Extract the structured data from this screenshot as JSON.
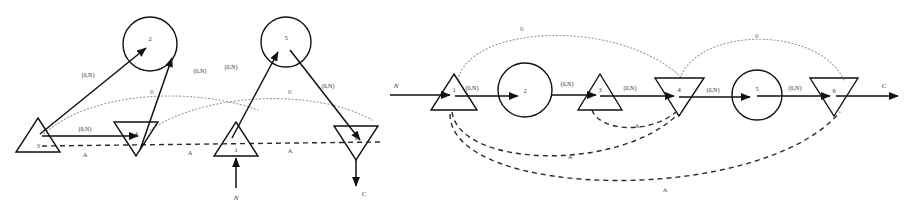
{
  "figure": {
    "background": "#ffffff",
    "ink": "#111111",
    "arc_r_color": "#9a9a9a",
    "arc_a_color": "#2b2b2b"
  },
  "edge_label": "(0,N)",
  "arc_labels": {
    "resource": "R",
    "assembly": "A"
  },
  "io_labels": {
    "input": "N",
    "output": "C"
  },
  "left_diagram": {
    "nodes": [
      {
        "id": "3",
        "label": "3",
        "shape": "triangle-up",
        "cx": 38,
        "cy": 138
      },
      {
        "id": "2",
        "label": "2",
        "shape": "circle",
        "cx": 150,
        "cy": 44
      },
      {
        "id": "4",
        "label": "4",
        "shape": "triangle-down",
        "cx": 136,
        "cy": 136
      },
      {
        "id": "5",
        "label": "5",
        "shape": "circle",
        "cx": 286,
        "cy": 42
      },
      {
        "id": "1",
        "label": "1",
        "shape": "triangle-up",
        "cx": 236,
        "cy": 142
      },
      {
        "id": "6",
        "label": "6",
        "shape": "triangle-down",
        "cx": 356,
        "cy": 140
      }
    ],
    "solid_edges": [
      {
        "from": "3",
        "to": "2",
        "label": "(0,N)"
      },
      {
        "from": "3",
        "to": "4",
        "label": "(0,N)"
      },
      {
        "from": "4",
        "to": "2",
        "label": "(0,N)"
      },
      {
        "from": "1",
        "to": "5",
        "label": "(0,N)"
      },
      {
        "from": "5",
        "to": "6",
        "label": "(0,N)"
      }
    ],
    "dotted_arcs": [
      {
        "label": "R"
      },
      {
        "label": "R"
      }
    ],
    "dashed_line_labels": [
      "A",
      "A",
      "A"
    ],
    "input": {
      "label": "N",
      "at": "1"
    },
    "output": {
      "label": "C",
      "at": "6"
    }
  },
  "right_diagram": {
    "nodes": [
      {
        "id": "1",
        "label": "1",
        "shape": "triangle-up",
        "cx": 454,
        "cy": 96
      },
      {
        "id": "2",
        "label": "2",
        "shape": "circle",
        "cx": 525,
        "cy": 90
      },
      {
        "id": "3",
        "label": "3",
        "shape": "triangle-up",
        "cx": 600,
        "cy": 95
      },
      {
        "id": "4",
        "label": "4",
        "shape": "triangle-down",
        "cx": 679,
        "cy": 92
      },
      {
        "id": "5",
        "label": "5",
        "shape": "circle",
        "cx": 757,
        "cy": 95
      },
      {
        "id": "6",
        "label": "6",
        "shape": "triangle-down",
        "cx": 833,
        "cy": 94
      }
    ],
    "solid_edges": [
      {
        "from": "1",
        "to": "2",
        "label": "(0,N)"
      },
      {
        "from": "2",
        "to": "3",
        "label": "(0,N)"
      },
      {
        "from": "3",
        "to": "4",
        "label": "(0,N)"
      },
      {
        "from": "4",
        "to": "5",
        "label": "(0,N)"
      },
      {
        "from": "5",
        "to": "6",
        "label": "(0,N)"
      }
    ],
    "dotted_arcs": [
      {
        "label": "R",
        "from": "1",
        "to": "4"
      },
      {
        "label": "R",
        "from": "4",
        "to": "6"
      }
    ],
    "dashed_arcs": [
      {
        "label": "A",
        "from": "3",
        "to": "4"
      },
      {
        "label": "A",
        "from": "1",
        "to": "4"
      },
      {
        "label": "A",
        "from": "1",
        "to": "6"
      }
    ],
    "input": {
      "label": "N",
      "at": "1"
    },
    "output": {
      "label": "C",
      "at": "6"
    }
  }
}
